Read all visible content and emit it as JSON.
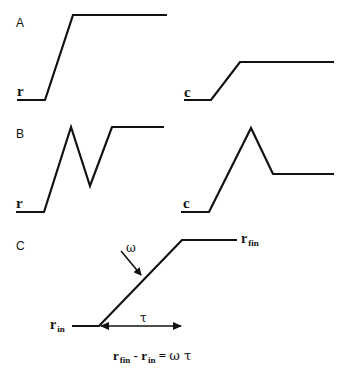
{
  "panels": {
    "A": {
      "label": "A",
      "input_signal": "r",
      "output_signal": "c",
      "description": "ramp step input; output ramps to lower level"
    },
    "B": {
      "label": "B",
      "input_signal": "r",
      "output_signal": "c",
      "description": "input rises, dips, then rises to plateau; output rises to peak then falls to plateau"
    },
    "C": {
      "label": "C",
      "start_label": "r",
      "start_sub": "in",
      "end_label": "r",
      "end_sub": "fin",
      "slope_symbol": "ω",
      "duration_symbol": "τ"
    }
  },
  "equation": {
    "lhs1": "r",
    "lhs1_sub": "fin",
    "minus": " - ",
    "lhs2": "r",
    "lhs2_sub": "in",
    "equals": " = ",
    "rhs": "ω τ"
  }
}
